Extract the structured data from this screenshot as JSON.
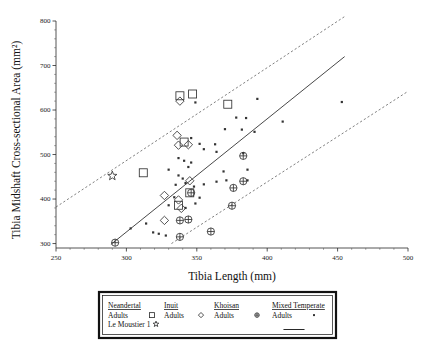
{
  "chart_data": {
    "type": "scatter",
    "title": "",
    "xlabel": "Tibia Length (mm)",
    "ylabel": "Tibia Midshaft Cross-sectional Area (mm²)",
    "xlim": [
      250,
      500
    ],
    "ylim": [
      290,
      800
    ],
    "xticks": [
      250,
      300,
      350,
      400,
      450,
      500
    ],
    "yticks": [
      300,
      400,
      500,
      600,
      700,
      800
    ],
    "xtick_labels": [
      "250",
      "300",
      "350",
      "400",
      "450",
      "500"
    ],
    "ytick_labels": [
      "300",
      "400",
      "500",
      "600",
      "700",
      "800"
    ],
    "grid": false,
    "legend_position": "below-plot",
    "series": [
      {
        "name": "Neandertal Adults",
        "marker": "open-square",
        "points": [
          [
            338,
            632
          ],
          [
            347,
            636
          ],
          [
            372,
            613
          ],
          [
            341,
            528
          ],
          [
            312,
            459
          ],
          [
            345,
            414
          ],
          [
            337,
            386
          ]
        ]
      },
      {
        "name": "Le Moustier 1",
        "marker": "open-star",
        "points": [
          [
            290,
            452
          ]
        ]
      },
      {
        "name": "Inuit Adults",
        "marker": "open-diamond",
        "points": [
          [
            338,
            620
          ],
          [
            336,
            543
          ],
          [
            337,
            521
          ],
          [
            344,
            522
          ],
          [
            327,
            408
          ],
          [
            345,
            441
          ],
          [
            337,
            398
          ],
          [
            339,
            379
          ],
          [
            327,
            352
          ]
        ]
      },
      {
        "name": "Khoisan Adults",
        "marker": "circle-plus",
        "points": [
          [
            383,
            497
          ],
          [
            346,
            414
          ],
          [
            376,
            425
          ],
          [
            383,
            440
          ],
          [
            338,
            352
          ],
          [
            375,
            385
          ],
          [
            360,
            327
          ],
          [
            338,
            315
          ],
          [
            292,
            302
          ],
          [
            344,
            354
          ]
        ]
      },
      {
        "name": "Mixed Temperate Adults",
        "marker": "small-dot",
        "points": [
          [
            349,
            617
          ],
          [
            393,
            625
          ],
          [
            411,
            574
          ],
          [
            453,
            618
          ],
          [
            378,
            583
          ],
          [
            385,
            582
          ],
          [
            370,
            557
          ],
          [
            382,
            556
          ],
          [
            391,
            551
          ],
          [
            346,
            537
          ],
          [
            352,
            524
          ],
          [
            363,
            523
          ],
          [
            355,
            512
          ],
          [
            364,
            506
          ],
          [
            383,
            503
          ],
          [
            337,
            492
          ],
          [
            341,
            486
          ],
          [
            346,
            482
          ],
          [
            344,
            472
          ],
          [
            386,
            466
          ],
          [
            330,
            466
          ],
          [
            369,
            462
          ],
          [
            337,
            453
          ],
          [
            340,
            446
          ],
          [
            335,
            432
          ],
          [
            342,
            436
          ],
          [
            364,
            439
          ],
          [
            371,
            442
          ],
          [
            355,
            433
          ],
          [
            348,
            428
          ],
          [
            352,
            403
          ],
          [
            334,
            404
          ],
          [
            349,
            390
          ],
          [
            330,
            386
          ],
          [
            342,
            380
          ],
          [
            303,
            334
          ],
          [
            319,
            325
          ],
          [
            323,
            322
          ],
          [
            328,
            318
          ],
          [
            314,
            345
          ],
          [
            386,
            442
          ]
        ]
      }
    ],
    "lines": [
      {
        "name": "regression",
        "style": "solid",
        "x": [
          289,
          455
        ],
        "y": [
          298,
          720
        ]
      },
      {
        "name": "upper-prediction",
        "style": "dashed",
        "x": [
          250,
          455
        ],
        "y": [
          382,
          810
        ]
      },
      {
        "name": "lower-prediction",
        "style": "dashed",
        "x": [
          332,
          500
        ],
        "y": [
          300,
          642
        ]
      }
    ]
  },
  "legend": {
    "groups": [
      {
        "heading": "Neandertal",
        "rows": [
          {
            "label": "Adults",
            "marker": "open-square"
          },
          {
            "label": "Le Moustier 1",
            "marker": "open-star"
          }
        ]
      },
      {
        "heading": "Inuit",
        "rows": [
          {
            "label": "Adults",
            "marker": "open-diamond"
          }
        ]
      },
      {
        "heading": "Khoisan",
        "rows": [
          {
            "label": "Adults",
            "marker": "circle-plus"
          }
        ]
      },
      {
        "heading": "Mixed Temperate",
        "rows": [
          {
            "label": "Adults",
            "marker": "small-dot"
          },
          {
            "label": "",
            "marker": "solid-line"
          }
        ]
      }
    ]
  },
  "colors": {
    "ink": "#1a1a1a",
    "marker_stroke": "#333333",
    "line": "#333333",
    "legend_border": "#111111",
    "background": "#ffffff"
  }
}
